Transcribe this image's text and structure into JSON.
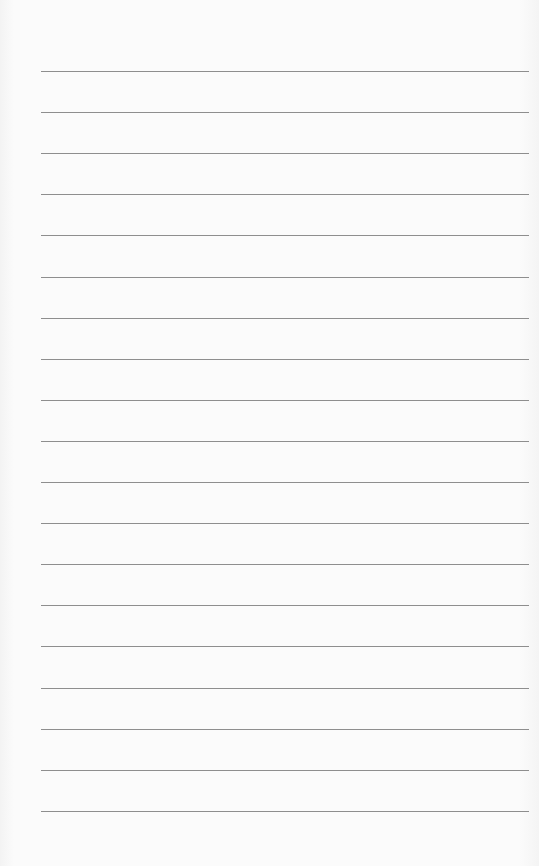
{
  "paper": {
    "type": "lined-paper",
    "background_color": "#fafafa",
    "line_color": "#8e8e8e",
    "line_count": 19,
    "first_line_y": 71,
    "line_spacing": 41.1,
    "line_left": 41,
    "line_right": 529
  }
}
